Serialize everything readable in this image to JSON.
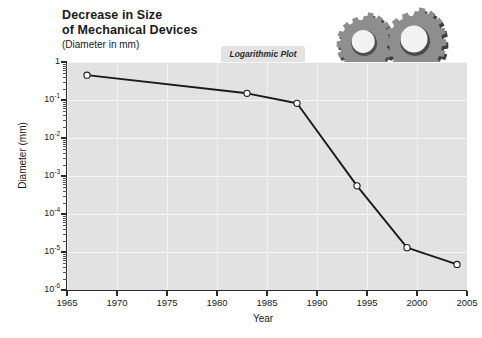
{
  "title": {
    "line1": "Decrease in Size",
    "line2": "of Mechanical Devices",
    "subtitle": "(Diameter in mm)"
  },
  "annotation": {
    "label": "Logarithmic Plot"
  },
  "artwork": {
    "name": "gears-illustration",
    "gear_color": "#8c8c8c",
    "gear_shadow_color": "#4a4a4a"
  },
  "colors": {
    "plot_background": "#e2e2e2",
    "gridline": "#f7f7f7",
    "axis": "#2b2b2b",
    "series_line": "#1a1a1a",
    "marker_fill": "#ffffff",
    "page_background": "#ffffff"
  },
  "chart_data": {
    "type": "line",
    "title": "Decrease in Size of Mechanical Devices (Diameter in mm)",
    "subtitle": "Logarithmic Plot",
    "xlabel": "Year",
    "ylabel": "Diameter (mm)",
    "yscale": "log",
    "xlim": [
      1965,
      2005
    ],
    "ylim": [
      1e-06,
      1
    ],
    "grid": true,
    "legend": "none",
    "xticks": [
      1965,
      1970,
      1975,
      1980,
      1985,
      1990,
      1995,
      2000,
      2005
    ],
    "xtick_labels": [
      "1965",
      "1970",
      "1975",
      "1980",
      "1985",
      "1990",
      "1995",
      "2000",
      "2005"
    ],
    "yticks": [
      1,
      0.1,
      0.01,
      0.001,
      0.0001,
      1e-05,
      1e-06
    ],
    "ytick_labels": [
      "1",
      "10⁻¹",
      "10⁻²",
      "10⁻³",
      "10⁻⁴",
      "10⁻⁵",
      "10⁻⁶"
    ],
    "ytick_mantissa": [
      "1",
      "10",
      "10",
      "10",
      "10",
      "10",
      "10"
    ],
    "ytick_exponent": [
      "",
      "-1",
      "-2",
      "-3",
      "-4",
      "-5",
      "-6"
    ],
    "series": [
      {
        "name": "Mechanical device diameter",
        "marker": "open-circle",
        "x": [
          1967,
          1983,
          1988,
          1994,
          1999,
          2004
        ],
        "y": [
          0.45,
          0.15,
          0.082,
          0.00055,
          1.3e-05,
          4.7e-06
        ]
      }
    ]
  }
}
